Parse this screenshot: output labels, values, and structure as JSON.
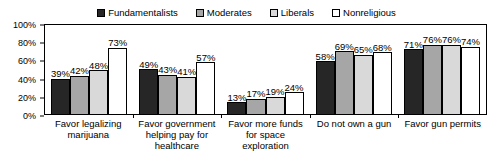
{
  "chart_data": {
    "type": "bar",
    "title": "",
    "xlabel": "",
    "ylabel": "",
    "ylim": [
      0,
      100
    ],
    "grid": false,
    "legend_position": "top-center",
    "categories": [
      "Favor legalizing marijuana",
      "Favor government helping pay for healthcare",
      "Favor more funds for space exploration",
      "Do not own a gun",
      "Favor gun permits"
    ],
    "y_ticks": [
      "0%",
      "20%",
      "40%",
      "60%",
      "80%",
      "100%"
    ],
    "y_tick_values": [
      0,
      20,
      40,
      60,
      80,
      100
    ],
    "series": [
      {
        "name": "Fundamentalists",
        "color": "#262626",
        "values": [
          39,
          49,
          13,
          58,
          71
        ]
      },
      {
        "name": "Moderates",
        "color": "#a6a6a6",
        "values": [
          42,
          43,
          17,
          69,
          76
        ]
      },
      {
        "name": "Liberals",
        "color": "#d9d9d9",
        "values": [
          48,
          41,
          19,
          65,
          76
        ]
      },
      {
        "name": "Nonreligious",
        "color": "#ffffff",
        "values": [
          73,
          57,
          24,
          68,
          74
        ]
      }
    ],
    "data_labels": [
      [
        "39%",
        "42%",
        "48%",
        "73%"
      ],
      [
        "49%",
        "43%",
        "41%",
        "57%"
      ],
      [
        "13%",
        "17%",
        "19%",
        "24%"
      ],
      [
        "58%",
        "69%",
        "65%",
        "68%"
      ],
      [
        "71%",
        "76%",
        "76%",
        "74%"
      ]
    ]
  },
  "legend": {
    "items": [
      {
        "label": "Fundamentalists",
        "swatch": "#262626"
      },
      {
        "label": "Moderates",
        "swatch": "#a6a6a6"
      },
      {
        "label": "Liberals",
        "swatch": "#d9d9d9"
      },
      {
        "label": "Nonreligious",
        "swatch": "#ffffff"
      }
    ]
  },
  "x_axis": {
    "labels": [
      "Favor legalizing marijuana",
      "Favor government helping pay for healthcare",
      "Favor more funds for space exploration",
      "Do not own a gun",
      "Favor gun permits"
    ]
  },
  "y_axis": {
    "labels": [
      "100%",
      "80%",
      "60%",
      "40%",
      "20%",
      "0%"
    ]
  }
}
